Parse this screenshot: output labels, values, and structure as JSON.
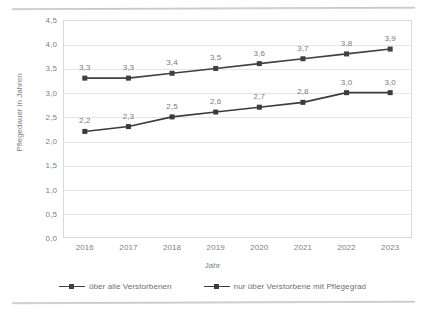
{
  "chart_data": {
    "type": "line",
    "title": "",
    "xlabel": "Jahr",
    "ylabel": "Pflegedauer in Jahren",
    "categories": [
      "2016",
      "2017",
      "2018",
      "2019",
      "2020",
      "2021",
      "2022",
      "2023"
    ],
    "series": [
      {
        "name": "über alle Verstorbenen",
        "values": [
          3.3,
          3.3,
          3.4,
          3.5,
          3.6,
          3.7,
          3.8,
          3.9
        ],
        "labels": [
          "3,3",
          "3,3",
          "3,4",
          "3,5",
          "3,6",
          "3,7",
          "3,8",
          "3,9"
        ],
        "color": "#404040",
        "marker": "square"
      },
      {
        "name": "nur über Verstorbene mit Pflegegrad",
        "values": [
          2.2,
          2.3,
          2.5,
          2.6,
          2.7,
          2.8,
          3.0,
          3.0
        ],
        "labels": [
          "2,2",
          "2,3",
          "2,5",
          "2,6",
          "2,7",
          "2,8",
          "3,0",
          "3,0"
        ],
        "color": "#3b3b3b",
        "marker": "square"
      }
    ],
    "ylim": [
      0,
      4.5
    ],
    "ytick_values": [
      0.0,
      0.5,
      1.0,
      1.5,
      2.0,
      2.5,
      3.0,
      3.5,
      4.0,
      4.5
    ],
    "ytick_labels": [
      "0,0",
      "0,5",
      "1,0",
      "1,5",
      "2,0",
      "2,5",
      "3,0",
      "3,5",
      "4,0",
      "4,5"
    ],
    "grid": "horizontal",
    "legend_position": "bottom",
    "decimal_separator": ",",
    "colors": {
      "line": "#404040",
      "marker": "#3b3b3b",
      "gridline": "#e6e6e6",
      "axis_text": "#808080",
      "plot_border": "#d9d9d9"
    }
  }
}
